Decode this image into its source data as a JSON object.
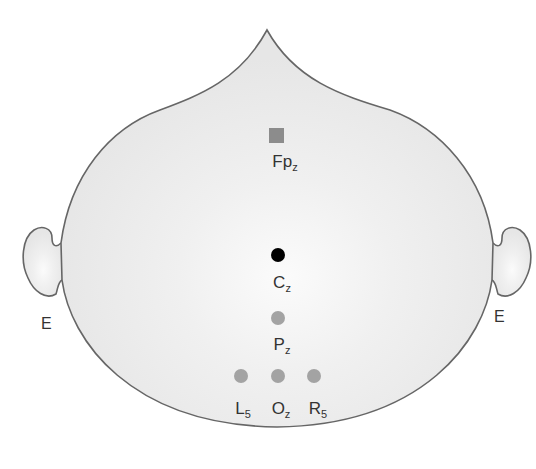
{
  "diagram": {
    "type": "electrode-placement-head-map",
    "colors": {
      "head_fill": "#ededed",
      "head_center_highlight": "#fafafa",
      "outline": "#666666",
      "active_electrode": "#000000",
      "reference_electrode": "#999999",
      "ground_electrode": "#8c8c8c"
    },
    "ears": {
      "left_label": "E",
      "right_label": "E"
    },
    "electrodes": [
      {
        "id": "Fpz",
        "base": "Fp",
        "sub": "z",
        "shape": "square",
        "role": "ground",
        "x": 277,
        "y": 136
      },
      {
        "id": "Cz",
        "base": "C",
        "sub": "z",
        "shape": "circle",
        "role": "active",
        "x": 278,
        "y": 255
      },
      {
        "id": "Pz",
        "base": "P",
        "sub": "z",
        "shape": "circle",
        "role": "reference",
        "x": 278,
        "y": 318
      },
      {
        "id": "L5",
        "base": "L",
        "sub": "5",
        "shape": "circle",
        "role": "reference",
        "x": 241,
        "y": 376
      },
      {
        "id": "Oz",
        "base": "O",
        "sub": "z",
        "shape": "circle",
        "role": "reference",
        "x": 278,
        "y": 376
      },
      {
        "id": "R5",
        "base": "R",
        "sub": "5",
        "shape": "circle",
        "role": "reference",
        "x": 314,
        "y": 376
      }
    ]
  }
}
